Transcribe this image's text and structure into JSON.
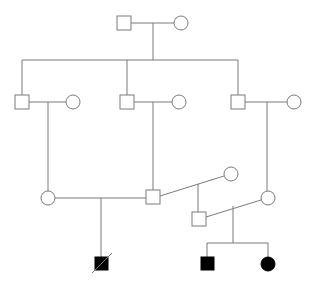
{
  "diagram": {
    "type": "pedigree",
    "colors": {
      "line": "#7a7a7a",
      "affected": "#000000",
      "unaffected": "#ffffff"
    },
    "individuals": [
      {
        "id": "I-1",
        "sex": "male",
        "affected": false,
        "deceased": false,
        "x": 124,
        "y": 23
      },
      {
        "id": "I-2",
        "sex": "female",
        "affected": false,
        "deceased": false,
        "x": 181,
        "y": 23
      },
      {
        "id": "II-1",
        "sex": "male",
        "affected": false,
        "deceased": false,
        "x": 22,
        "y": 102
      },
      {
        "id": "II-2",
        "sex": "female",
        "affected": false,
        "deceased": false,
        "x": 73,
        "y": 102
      },
      {
        "id": "II-3",
        "sex": "male",
        "affected": false,
        "deceased": false,
        "x": 127,
        "y": 102
      },
      {
        "id": "II-4",
        "sex": "female",
        "affected": false,
        "deceased": false,
        "x": 179,
        "y": 102
      },
      {
        "id": "II-5",
        "sex": "male",
        "affected": false,
        "deceased": false,
        "x": 238,
        "y": 102
      },
      {
        "id": "II-6",
        "sex": "female",
        "affected": false,
        "deceased": false,
        "x": 294,
        "y": 102
      },
      {
        "id": "III-1",
        "sex": "female",
        "affected": false,
        "deceased": false,
        "x": 48,
        "y": 198
      },
      {
        "id": "III-2",
        "sex": "male",
        "affected": false,
        "deceased": false,
        "x": 153,
        "y": 197
      },
      {
        "id": "III-3",
        "sex": "female",
        "affected": false,
        "deceased": false,
        "x": 231,
        "y": 174
      },
      {
        "id": "III-4",
        "sex": "male",
        "affected": false,
        "deceased": false,
        "x": 199,
        "y": 219
      },
      {
        "id": "III-5",
        "sex": "female",
        "affected": false,
        "deceased": false,
        "x": 268,
        "y": 198
      },
      {
        "id": "IV-1",
        "sex": "male",
        "affected": true,
        "deceased": true,
        "x": 101,
        "y": 264
      },
      {
        "id": "IV-2",
        "sex": "male",
        "affected": true,
        "deceased": false,
        "x": 207,
        "y": 264
      },
      {
        "id": "IV-3",
        "sex": "female",
        "affected": true,
        "deceased": false,
        "x": 268,
        "y": 264
      }
    ]
  }
}
